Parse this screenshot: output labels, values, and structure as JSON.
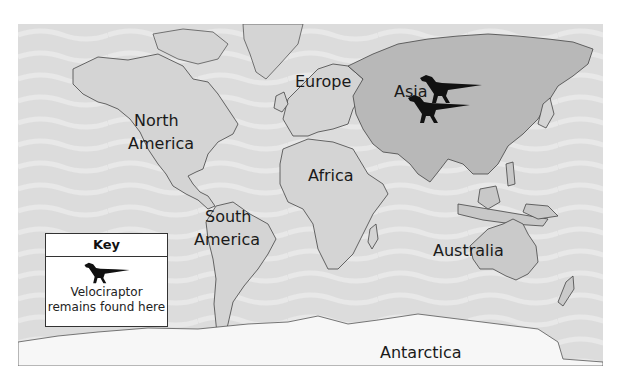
{
  "map": {
    "ocean_color": "#dcdcdc",
    "land_color": "#d4d4d4",
    "highlight_land_color": "#b8b8b8",
    "antarctica_color": "#f7f7f7",
    "labels": {
      "north_america_1": "North",
      "north_america_2": "America",
      "europe": "Europe",
      "asia": "Asia",
      "africa": "Africa",
      "south_america_1": "South",
      "south_america_2": "America",
      "australia": "Australia",
      "antarctica": "Antarctica"
    },
    "markers": [
      {
        "name": "velociraptor-marker-1",
        "region": "Asia"
      },
      {
        "name": "velociraptor-marker-2",
        "region": "Asia"
      }
    ]
  },
  "key": {
    "title": "Key",
    "icon": "velociraptor-silhouette-icon",
    "line1": "Velociraptor",
    "line2": "remains found here"
  }
}
